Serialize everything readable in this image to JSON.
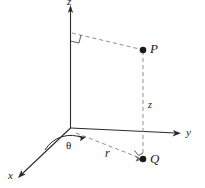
{
  "figure": {
    "colors": {
      "line": "#2b2b2b",
      "dashed": "#8a8a8a",
      "point": "#1a1a1a",
      "background": "#ffffff"
    },
    "axes": [
      {
        "id": "z",
        "label": "z",
        "direction": "up"
      },
      {
        "id": "y",
        "label": "y",
        "direction": "right"
      },
      {
        "id": "x",
        "label": "x",
        "direction": "lower-left"
      }
    ],
    "points": [
      {
        "id": "P",
        "label": "P",
        "kind": "point-in-space"
      },
      {
        "id": "Q",
        "label": "Q",
        "kind": "projection-on-xy-plane"
      }
    ],
    "measures": [
      {
        "id": "z-height",
        "label": "z",
        "kind": "vertical-distance-P-to-Q"
      },
      {
        "id": "r-radius",
        "label": "r",
        "kind": "radial-distance-origin-to-Q"
      },
      {
        "id": "theta-angle",
        "label": "θ",
        "kind": "azimuth-angle-from-x-axis"
      }
    ],
    "markers": [
      {
        "id": "right-angle-z-axis",
        "label": "right-angle"
      },
      {
        "id": "right-angle-q",
        "label": "right-angle"
      }
    ]
  }
}
